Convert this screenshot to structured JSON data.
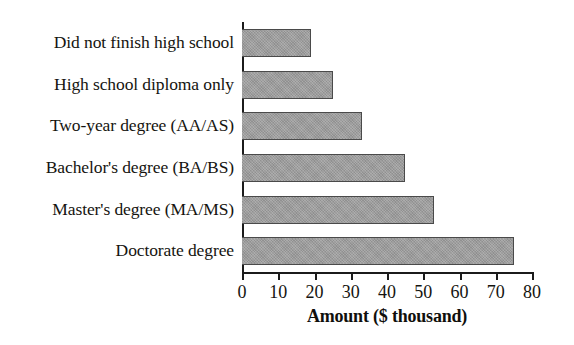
{
  "chart_data": {
    "type": "bar",
    "orientation": "horizontal",
    "title": "",
    "xlabel": "Amount ($ thousand)",
    "ylabel": "",
    "categories": [
      "Did not finish high school",
      "High school diploma only",
      "Two-year degree (AA/AS)",
      "Bachelor's degree (BA/BS)",
      "Master's degree (MA/MS)",
      "Doctorate degree"
    ],
    "values": [
      19,
      25,
      33,
      45,
      53,
      75
    ],
    "xlim": [
      0,
      80
    ],
    "ylim": null,
    "xticks": [
      0,
      10,
      20,
      30,
      40,
      50,
      60,
      70,
      80
    ],
    "xtick_labels": [
      "0",
      "10",
      "20",
      "30",
      "40",
      "50",
      "60",
      "70",
      "80"
    ],
    "grid": false,
    "legend": false,
    "legend_position": "none",
    "bar_color": "#9b9b9b",
    "bar_edge_color": "#4a4a4a",
    "axis_color": "#1b1b1b",
    "text_color": "#15140f"
  }
}
